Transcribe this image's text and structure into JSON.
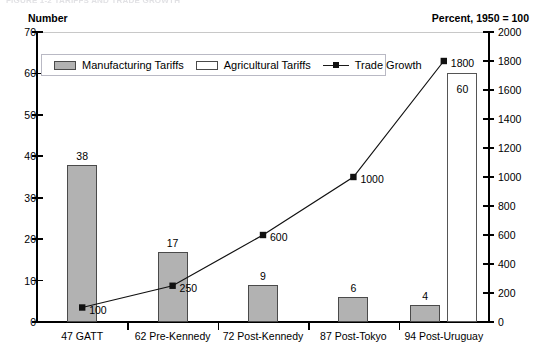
{
  "figure": {
    "title_strip": "FIGURE 1-2   TARIFFS AND TRADE GROWTH",
    "left_axis_caption": "Number",
    "right_axis_caption": "Percent, 1950 = 100"
  },
  "legend": {
    "items": [
      {
        "label": "Manufacturing Tariffs",
        "marker": "filled-square-swatch",
        "color": "#b2b2b2"
      },
      {
        "label": "Agricultural Tariffs",
        "marker": "empty-square-swatch",
        "color": "#ffffff"
      },
      {
        "label": "Trade Growth",
        "marker": "line-with-square-marker",
        "color": "#111111"
      }
    ]
  },
  "chart_data": {
    "type": "bar",
    "title": "",
    "xlabel": "",
    "ylabel": "Number",
    "y2label": "Percent, 1950 = 100",
    "categories": [
      "47 GATT",
      "62 Pre-Kennedy",
      "72 Post-Kennedy",
      "87 Post-Tokyo",
      "94 Post-Uruguay"
    ],
    "ylim": [
      0,
      70
    ],
    "y_ticks": [
      0,
      10,
      20,
      30,
      40,
      50,
      60,
      70
    ],
    "y2lim": [
      0,
      2000
    ],
    "y2_ticks": [
      0,
      200,
      400,
      600,
      800,
      1000,
      1200,
      1400,
      1600,
      1800,
      2000
    ],
    "grid": false,
    "legend_position": "upper-left-inside",
    "series": [
      {
        "name": "Manufacturing Tariffs",
        "axis": "left",
        "kind": "bar",
        "color": "#b2b2b2",
        "values": [
          38,
          17,
          9,
          6,
          4
        ],
        "labels": [
          "38",
          "17",
          "9",
          "6",
          "4"
        ]
      },
      {
        "name": "Agricultural Tariffs",
        "axis": "left",
        "kind": "bar",
        "color": "#ffffff",
        "values": [
          null,
          null,
          null,
          null,
          60
        ],
        "labels": [
          "",
          "",
          "",
          "",
          "60"
        ]
      },
      {
        "name": "Trade Growth",
        "axis": "right",
        "kind": "line",
        "color": "#111111",
        "values": [
          100,
          250,
          600,
          1000,
          1800
        ],
        "labels": [
          "100",
          "250",
          "600",
          "1000",
          "1800"
        ]
      }
    ]
  }
}
